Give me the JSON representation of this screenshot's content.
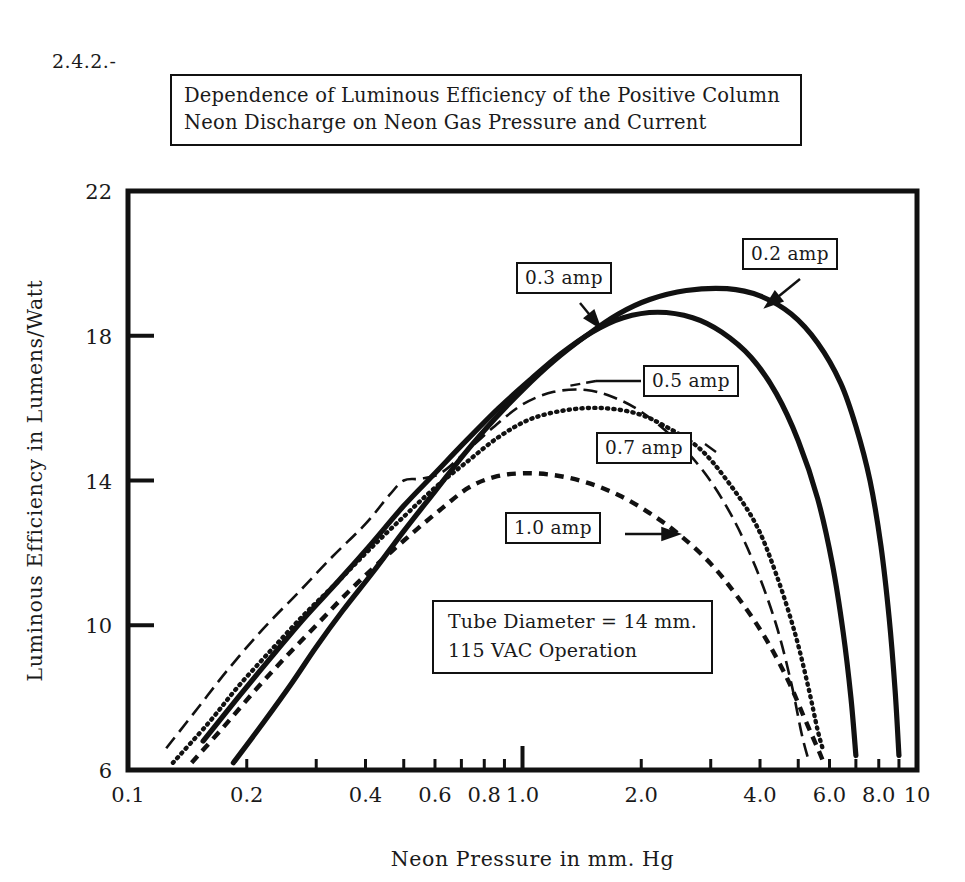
{
  "page": {
    "section_number": "2.4.2.-",
    "faint_header_text": ""
  },
  "title": {
    "line1": "Dependence of Luminous Efficiency of the Positive Column",
    "line2": "Neon Discharge on Neon Gas Pressure and Current"
  },
  "note": {
    "line1": "Tube Diameter = 14 mm.",
    "line2": "115 VAC Operation"
  },
  "callouts": {
    "c02": "0.2 amp",
    "c03": "0.3 amp",
    "c05": "0.5 amp",
    "c07": "0.7 amp",
    "c10": "1.0 amp"
  },
  "axes": {
    "x_title": "Neon Pressure in mm. Hg",
    "y_title": "Luminous Efficiency in Lumens/Watt",
    "x_ticks": [
      "0.1",
      "0.2",
      "0.4",
      "0.6",
      "0.8",
      "1.0",
      "2.0",
      "4.0",
      "6.0",
      "8.0",
      "10"
    ],
    "y_ticks": [
      "6",
      "10",
      "14",
      "18",
      "22"
    ]
  },
  "colors": {
    "ink": "#111111",
    "background": "#ffffff"
  },
  "chart_data": {
    "type": "line",
    "title": "Dependence of Luminous Efficiency of the Positive Column Neon Discharge on Neon Gas Pressure and Current",
    "xlabel": "Neon Pressure in mm. Hg",
    "ylabel": "Luminous Efficiency in Lumens/Watt",
    "xscale": "log",
    "yscale": "linear",
    "xlim": [
      0.1,
      10
    ],
    "ylim": [
      6,
      22
    ],
    "xticks": [
      0.1,
      0.2,
      0.4,
      0.6,
      0.8,
      1.0,
      2.0,
      4.0,
      6.0,
      8.0,
      10
    ],
    "xticklabels": [
      "0.1",
      "0.2",
      "0.4",
      "0.6",
      "0.8",
      "1.0",
      "2.0",
      "4.0",
      "6.0",
      "8.0",
      "10"
    ],
    "yticks": [
      6,
      10,
      14,
      18,
      22
    ],
    "yticklabels": [
      "6",
      "10",
      "14",
      "18",
      "22"
    ],
    "grid": false,
    "legend": "inline annotation boxes with arrows",
    "annotations": [
      "Tube Diameter = 14 mm.",
      "115 VAC Operation"
    ],
    "series": [
      {
        "name": "0.2 amp",
        "style": "solid-thick",
        "points": [
          [
            0.185,
            6.2
          ],
          [
            0.22,
            7.3
          ],
          [
            0.26,
            8.4
          ],
          [
            0.3,
            9.4
          ],
          [
            0.35,
            10.4
          ],
          [
            0.42,
            11.5
          ],
          [
            0.5,
            12.6
          ],
          [
            0.6,
            13.7
          ],
          [
            0.72,
            14.8
          ],
          [
            0.85,
            15.7
          ],
          [
            1.0,
            16.5
          ],
          [
            1.2,
            17.3
          ],
          [
            1.45,
            18.0
          ],
          [
            1.75,
            18.6
          ],
          [
            2.1,
            19.0
          ],
          [
            2.6,
            19.25
          ],
          [
            3.3,
            19.3
          ],
          [
            4.0,
            19.1
          ],
          [
            4.8,
            18.6
          ],
          [
            5.6,
            17.8
          ],
          [
            6.4,
            16.7
          ],
          [
            7.0,
            15.5
          ],
          [
            7.6,
            14.0
          ],
          [
            8.1,
            12.2
          ],
          [
            8.5,
            10.2
          ],
          [
            8.8,
            8.2
          ],
          [
            9.0,
            6.4
          ]
        ]
      },
      {
        "name": "0.3 amp",
        "style": "solid-thick",
        "points": [
          [
            0.155,
            6.8
          ],
          [
            0.19,
            8.0
          ],
          [
            0.23,
            9.1
          ],
          [
            0.28,
            10.2
          ],
          [
            0.34,
            11.2
          ],
          [
            0.41,
            12.2
          ],
          [
            0.5,
            13.3
          ],
          [
            0.6,
            14.2
          ],
          [
            0.72,
            15.1
          ],
          [
            0.87,
            16.0
          ],
          [
            1.05,
            16.8
          ],
          [
            1.25,
            17.5
          ],
          [
            1.5,
            18.1
          ],
          [
            1.8,
            18.5
          ],
          [
            2.2,
            18.65
          ],
          [
            2.7,
            18.5
          ],
          [
            3.2,
            18.1
          ],
          [
            3.8,
            17.4
          ],
          [
            4.4,
            16.4
          ],
          [
            5.0,
            15.1
          ],
          [
            5.6,
            13.5
          ],
          [
            6.1,
            11.7
          ],
          [
            6.5,
            9.8
          ],
          [
            6.8,
            8.0
          ],
          [
            7.0,
            6.4
          ]
        ]
      },
      {
        "name": "0.5 amp",
        "style": "long-dash-thin",
        "points": [
          [
            0.125,
            6.6
          ],
          [
            0.15,
            7.7
          ],
          [
            0.18,
            8.8
          ],
          [
            0.22,
            9.9
          ],
          [
            0.27,
            10.9
          ],
          [
            0.33,
            11.9
          ],
          [
            0.4,
            12.8
          ],
          [
            0.46,
            13.6
          ],
          [
            0.5,
            14.0
          ],
          [
            0.55,
            14.05
          ],
          [
            0.62,
            14.2
          ],
          [
            0.72,
            14.8
          ],
          [
            0.85,
            15.5
          ],
          [
            1.0,
            16.1
          ],
          [
            1.2,
            16.45
          ],
          [
            1.45,
            16.5
          ],
          [
            1.7,
            16.3
          ],
          [
            2.0,
            15.9
          ],
          [
            2.4,
            15.2
          ],
          [
            2.9,
            14.2
          ],
          [
            3.4,
            13.0
          ],
          [
            3.9,
            11.6
          ],
          [
            4.4,
            10.0
          ],
          [
            4.8,
            8.4
          ],
          [
            5.1,
            7.0
          ],
          [
            5.3,
            6.3
          ]
        ]
      },
      {
        "name": "0.7 amp",
        "style": "dotted",
        "points": [
          [
            0.13,
            6.2
          ],
          [
            0.16,
            7.3
          ],
          [
            0.19,
            8.3
          ],
          [
            0.23,
            9.3
          ],
          [
            0.28,
            10.3
          ],
          [
            0.34,
            11.2
          ],
          [
            0.41,
            12.1
          ],
          [
            0.5,
            13.0
          ],
          [
            0.6,
            13.8
          ],
          [
            0.72,
            14.5
          ],
          [
            0.87,
            15.2
          ],
          [
            1.05,
            15.7
          ],
          [
            1.3,
            15.95
          ],
          [
            1.6,
            16.0
          ],
          [
            1.95,
            15.85
          ],
          [
            2.3,
            15.5
          ],
          [
            2.8,
            14.9
          ],
          [
            3.3,
            14.0
          ],
          [
            3.9,
            12.8
          ],
          [
            4.4,
            11.4
          ],
          [
            4.9,
            9.8
          ],
          [
            5.3,
            8.3
          ],
          [
            5.6,
            7.1
          ],
          [
            5.8,
            6.5
          ]
        ]
      },
      {
        "name": "1.0 amp",
        "style": "dashed",
        "points": [
          [
            0.145,
            6.2
          ],
          [
            0.175,
            7.2
          ],
          [
            0.21,
            8.2
          ],
          [
            0.25,
            9.1
          ],
          [
            0.3,
            10.0
          ],
          [
            0.36,
            10.9
          ],
          [
            0.43,
            11.7
          ],
          [
            0.52,
            12.5
          ],
          [
            0.62,
            13.2
          ],
          [
            0.73,
            13.8
          ],
          [
            0.85,
            14.1
          ],
          [
            1.0,
            14.2
          ],
          [
            1.2,
            14.15
          ],
          [
            1.45,
            13.95
          ],
          [
            1.75,
            13.6
          ],
          [
            2.1,
            13.1
          ],
          [
            2.5,
            12.5
          ],
          [
            3.0,
            11.7
          ],
          [
            3.5,
            10.8
          ],
          [
            4.1,
            9.7
          ],
          [
            4.7,
            8.5
          ],
          [
            5.2,
            7.4
          ],
          [
            5.6,
            6.6
          ],
          [
            5.8,
            6.2
          ]
        ]
      }
    ]
  }
}
